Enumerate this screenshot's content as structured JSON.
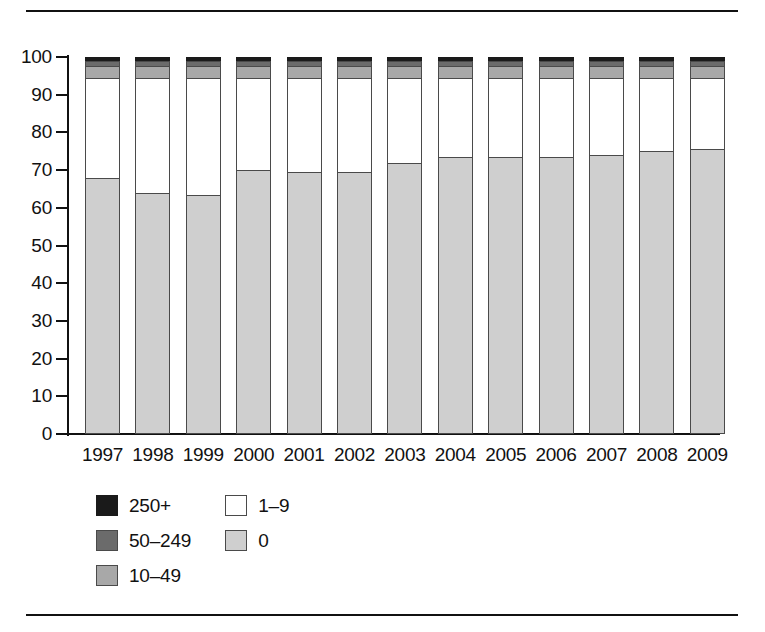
{
  "chart_data": {
    "type": "bar",
    "title": "",
    "subtitle": "",
    "xlabel": "",
    "ylabel": "",
    "stacked": true,
    "stack_mode": "percent",
    "grid": false,
    "legend_position": "bottom-left",
    "ylim": [
      0,
      100
    ],
    "y_ticks": [
      0,
      10,
      20,
      30,
      40,
      50,
      60,
      70,
      80,
      90,
      100
    ],
    "y_tick_labels": [
      "0",
      "10",
      "20",
      "30",
      "40",
      "50",
      "60",
      "70",
      "80",
      "90",
      "100"
    ],
    "categories": [
      "1997",
      "1998",
      "1999",
      "2000",
      "2001",
      "2002",
      "2003",
      "2004",
      "2005",
      "2006",
      "2007",
      "2008",
      "2009"
    ],
    "series": [
      {
        "name": "0",
        "color": "#cfcfcf",
        "values": [
          68.0,
          64.0,
          63.5,
          70.0,
          69.5,
          69.5,
          72.0,
          73.5,
          73.5,
          73.5,
          74.0,
          75.0,
          75.5
        ]
      },
      {
        "name": "1–9",
        "color": "#ffffff",
        "values": [
          26.5,
          30.5,
          31.0,
          24.5,
          25.0,
          25.0,
          22.5,
          21.0,
          21.0,
          21.0,
          20.5,
          19.5,
          19.0
        ]
      },
      {
        "name": "10–49",
        "color": "#a8a8a8",
        "values": [
          3.2,
          3.2,
          3.2,
          3.2,
          3.2,
          3.2,
          3.2,
          3.2,
          3.2,
          3.2,
          3.2,
          3.2,
          3.2
        ]
      },
      {
        "name": "50–249",
        "color": "#6b6b6b",
        "values": [
          1.3,
          1.3,
          1.3,
          1.3,
          1.3,
          1.3,
          1.3,
          1.3,
          1.3,
          1.3,
          1.3,
          1.3,
          1.3
        ]
      },
      {
        "name": "250+",
        "color": "#1a1a1a",
        "values": [
          1.0,
          1.0,
          1.0,
          1.0,
          1.0,
          1.0,
          1.0,
          1.0,
          1.0,
          1.0,
          1.0,
          1.0,
          1.0
        ]
      }
    ]
  },
  "legend": {
    "column_left": [
      {
        "label": "250+",
        "swatch": "sw-250"
      },
      {
        "label": "50–249",
        "swatch": "sw-50-249"
      },
      {
        "label": "10–49",
        "swatch": "sw-10-49"
      }
    ],
    "column_right": [
      {
        "label": "1–9",
        "swatch": "sw-1-9"
      },
      {
        "label": "0",
        "swatch": "sw-0"
      }
    ]
  },
  "colors": {
    "size_250_plus": "#1a1a1a",
    "size_50_249": "#6b6b6b",
    "size_10_49": "#a8a8a8",
    "size_1_9": "#ffffff",
    "size_0": "#cfcfcf",
    "axis": "#111111",
    "outline": "#4a4a4a",
    "background": "#ffffff"
  }
}
